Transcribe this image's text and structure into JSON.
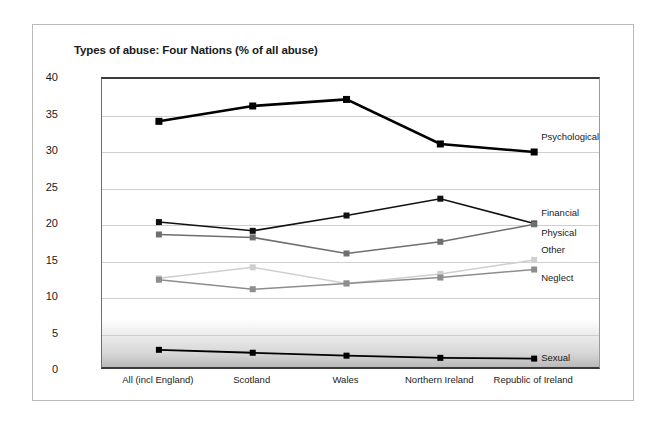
{
  "card": {
    "name": "chart-card"
  },
  "chart_data": {
    "type": "line",
    "title": "Types of abuse: Four Nations (% of all abuse)",
    "xlabel": "",
    "ylabel": "",
    "ylim": [
      0,
      40
    ],
    "ytick_step": 5,
    "yticks": [
      "0",
      "5",
      "10",
      "15",
      "20",
      "25",
      "30",
      "35",
      "40"
    ],
    "grid": true,
    "legend_position": "right-inline",
    "categories": [
      "All (incl England)",
      "Scotland",
      "Wales",
      "Northern Ireland",
      "Republic of Ireland"
    ],
    "series": [
      {
        "name": "Psychological",
        "color": "#000000",
        "width": 2.6,
        "marker": "square",
        "marker_size": 7,
        "values": [
          34.2,
          36.3,
          37.2,
          31.1,
          30.0
        ],
        "label_offset_y": -14
      },
      {
        "name": "Financial",
        "color": "#111111",
        "width": 1.5,
        "marker": "square",
        "marker_size": 6,
        "values": [
          20.4,
          19.2,
          21.3,
          23.6,
          20.2
        ],
        "label_offset_y": -10
      },
      {
        "name": "Physical",
        "color": "#6f6f6f",
        "width": 1.5,
        "marker": "square",
        "marker_size": 6,
        "values": [
          18.7,
          18.3,
          16.1,
          17.7,
          20.1
        ],
        "label_offset_y": 10
      },
      {
        "name": "Other",
        "color": "#cfcfcf",
        "width": 1.5,
        "marker": "square",
        "marker_size": 6,
        "values": [
          12.7,
          14.2,
          12.0,
          13.3,
          15.2
        ],
        "label_offset_y": -9
      },
      {
        "name": "Neglect",
        "color": "#8d8d8d",
        "width": 1.5,
        "marker": "square",
        "marker_size": 6,
        "values": [
          12.5,
          11.2,
          12.0,
          12.8,
          13.9
        ],
        "label_offset_y": 9
      },
      {
        "name": "Sexual",
        "color": "#000000",
        "width": 1.8,
        "marker": "square",
        "marker_size": 6,
        "values": [
          2.9,
          2.5,
          2.1,
          1.8,
          1.7
        ],
        "label_offset_y": 0
      }
    ]
  }
}
